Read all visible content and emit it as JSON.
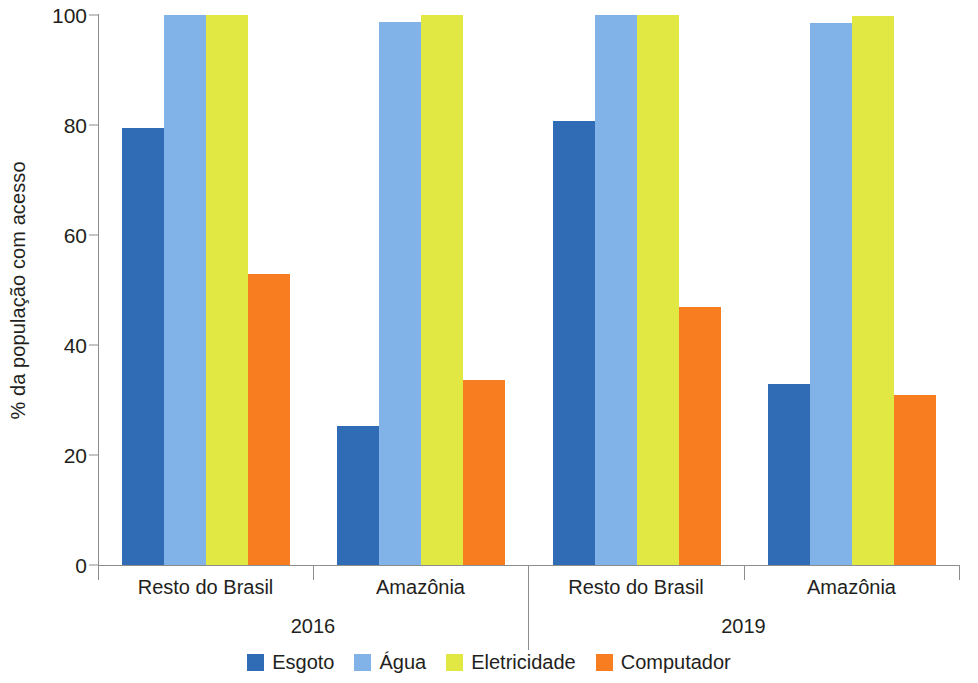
{
  "chart_data": {
    "type": "bar",
    "title": "",
    "subtitle": "",
    "xlabel": "",
    "ylabel": "% da população com acesso",
    "ylim": [
      0,
      100
    ],
    "yticks": [
      0,
      20,
      40,
      60,
      80,
      100
    ],
    "ytick_labels": [
      "0",
      "20",
      "40",
      "60",
      "80",
      "100"
    ],
    "grid": false,
    "legend_position": "bottom",
    "group_axis_levels": [
      "region",
      "year"
    ],
    "categories": [
      "Resto do Brasil",
      "Amazônia",
      "Resto do Brasil",
      "Amazônia"
    ],
    "periods": [
      "2016",
      "2019"
    ],
    "period_groups": [
      {
        "label": "2016",
        "categories": [
          "Resto do Brasil",
          "Amazônia"
        ]
      },
      {
        "label": "2019",
        "categories": [
          "Resto do Brasil",
          "Amazônia"
        ]
      }
    ],
    "series": [
      {
        "name": "Esgoto",
        "color": "#2f6cb5",
        "values": [
          79.5,
          25.3,
          80.7,
          33.0
        ]
      },
      {
        "name": "Água",
        "color": "#82b3e8",
        "values": [
          100.0,
          98.8,
          100.0,
          98.5
        ]
      },
      {
        "name": "Eletricidade",
        "color": "#e2e843",
        "values": [
          100.0,
          100.0,
          100.0,
          99.8
        ]
      },
      {
        "name": "Computador",
        "color": "#f77d20",
        "values": [
          53.0,
          33.6,
          47.0,
          31.0
        ]
      }
    ]
  },
  "colors": {
    "esgoto": "#2f6cb5",
    "agua": "#82b3e8",
    "eletricidade": "#e2e843",
    "computador": "#f77d20",
    "axis": "#8c8c8c",
    "text": "#231f20",
    "background": "#ffffff"
  },
  "axis": {
    "y_title": "% da população com acesso",
    "y_tick_0": "0",
    "y_tick_1": "20",
    "y_tick_2": "40",
    "y_tick_3": "60",
    "y_tick_4": "80",
    "y_tick_5": "100"
  },
  "categories": {
    "g0": "Resto do Brasil",
    "g1": "Amazônia",
    "g2": "Resto do Brasil",
    "g3": "Amazônia"
  },
  "periods": {
    "p0": "2016",
    "p1": "2019"
  },
  "legend": {
    "items": [
      {
        "label": "Esgoto",
        "color": "#2f6cb5"
      },
      {
        "label": "Água",
        "color": "#82b3e8"
      },
      {
        "label": "Eletricidade",
        "color": "#e2e843"
      },
      {
        "label": "Computador",
        "color": "#f77d20"
      }
    ]
  }
}
